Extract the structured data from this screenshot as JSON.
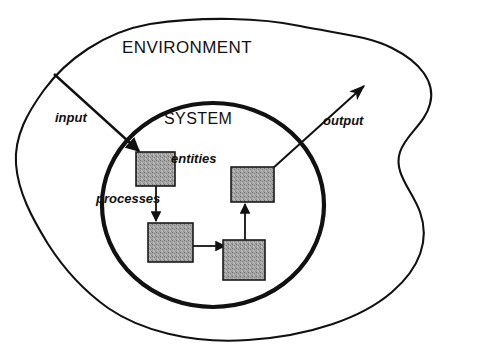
{
  "diagram": {
    "title_label": "ENVIRONMENT",
    "inner_label": "SYSTEM",
    "labels": {
      "input": "input",
      "output": "output",
      "entities": "entities",
      "processes": "processes"
    },
    "colors": {
      "stroke": "#111111",
      "box_fill": "#9e9e9e",
      "box_border": "#1a1a1a",
      "background": "#ffffff"
    },
    "boundaries": [
      {
        "name": "environment-boundary",
        "shape": "irregular-blob",
        "stroke_width": 2
      },
      {
        "name": "system-boundary",
        "shape": "ellipse",
        "stroke_width": 4
      }
    ],
    "nodes": [
      {
        "name": "entity-box-1",
        "x": 136,
        "y": 152,
        "w": 39,
        "h": 34
      },
      {
        "name": "entity-box-2",
        "x": 231,
        "y": 167,
        "w": 43,
        "h": 35
      },
      {
        "name": "entity-box-3",
        "x": 148,
        "y": 223,
        "w": 45,
        "h": 39
      },
      {
        "name": "entity-box-4",
        "x": 223,
        "y": 240,
        "w": 42,
        "h": 40
      }
    ],
    "flows": [
      {
        "name": "input-arrow",
        "from": "environment",
        "to": "entity-box-1",
        "label": "input"
      },
      {
        "name": "process-arrow-1",
        "from": "entity-box-1",
        "to": "entity-box-3",
        "label": "processes"
      },
      {
        "name": "process-arrow-2",
        "from": "entity-box-3",
        "to": "entity-box-4",
        "label": ""
      },
      {
        "name": "process-arrow-3",
        "from": "entity-box-4",
        "to": "entity-box-2",
        "label": ""
      },
      {
        "name": "output-arrow",
        "from": "entity-box-2",
        "to": "environment",
        "label": "output"
      }
    ]
  }
}
